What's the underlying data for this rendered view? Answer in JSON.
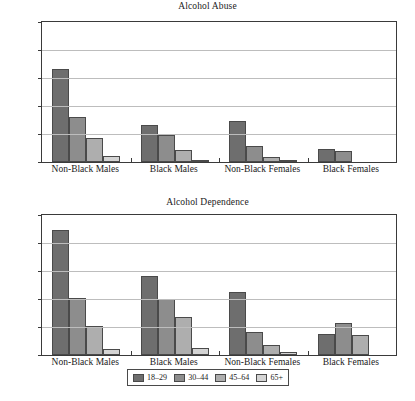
{
  "chart_data": [
    {
      "type": "bar",
      "title": "Alcohol Abuse",
      "xlabel": "",
      "ylabel": "",
      "ylim": [
        0,
        15
      ],
      "yticks": [
        0,
        3,
        6,
        9,
        12,
        15
      ],
      "grid": true,
      "legend_position": "bottom",
      "categories": [
        "Non-Black Males",
        "Black Males",
        "Non-Black Females",
        "Black Females"
      ],
      "series": [
        {
          "name": "18–29",
          "color": "#6e6e6e",
          "values": [
            10.0,
            4.0,
            4.4,
            1.4
          ]
        },
        {
          "name": "30–44",
          "color": "#8d8d8d",
          "values": [
            4.8,
            2.85,
            1.7,
            1.15
          ]
        },
        {
          "name": "45–64",
          "color": "#aeaeae",
          "values": [
            2.6,
            1.3,
            0.5,
            0.0
          ]
        },
        {
          "name": "65+",
          "color": "#d4d4d4",
          "values": [
            0.6,
            0.05,
            0.05,
            0.0
          ]
        }
      ]
    },
    {
      "type": "bar",
      "title": "Alcohol Dependence",
      "xlabel": "",
      "ylabel": "",
      "ylim": [
        0,
        15
      ],
      "yticks": [
        0,
        3,
        6,
        9,
        12,
        15
      ],
      "grid": true,
      "legend_position": "bottom",
      "categories": [
        "Non-Black Males",
        "Black Males",
        "Non-Black Females",
        "Black Females"
      ],
      "series": [
        {
          "name": "18–29",
          "color": "#6e6e6e",
          "values": [
            13.4,
            8.5,
            6.8,
            2.2
          ]
        },
        {
          "name": "30–44",
          "color": "#8d8d8d",
          "values": [
            6.1,
            6.05,
            2.5,
            3.4
          ]
        },
        {
          "name": "45–64",
          "color": "#aeaeae",
          "values": [
            3.15,
            4.1,
            1.1,
            2.1
          ]
        },
        {
          "name": "65+",
          "color": "#d4d4d4",
          "values": [
            0.6,
            0.8,
            0.3,
            0.0
          ]
        }
      ]
    }
  ],
  "legend": {
    "items": [
      {
        "label": "18–29",
        "color": "#6e6e6e"
      },
      {
        "label": "30–44",
        "color": "#8d8d8d"
      },
      {
        "label": "45–64",
        "color": "#aeaeae"
      },
      {
        "label": "65+",
        "color": "#d4d4d4"
      }
    ]
  }
}
